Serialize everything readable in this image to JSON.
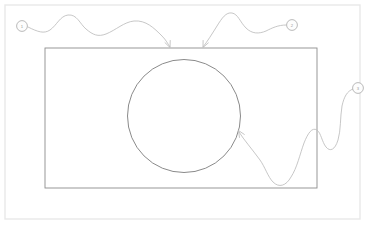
{
  "scene": {
    "type": "sketch-diagram",
    "background_color": "#ffffff",
    "width": 371,
    "height": 227
  },
  "frame": {
    "name": "outer-page-frame",
    "x": 5,
    "y": 5,
    "width": 355,
    "height": 214,
    "stroke": "#e8e8e8",
    "stroke_width": 1.4
  },
  "rectangle": {
    "name": "main-rectangle",
    "x": 45,
    "y": 48,
    "width": 272,
    "height": 140,
    "stroke": "#8d8d8d",
    "stroke_width": 0.9,
    "fill": "none"
  },
  "circle": {
    "name": "main-circle",
    "cx": 184,
    "cy": 116,
    "r": 56.5,
    "stroke": "#7d7d7d",
    "stroke_width": 0.9,
    "fill": "none"
  },
  "markers": [
    {
      "id": "marker-1",
      "label": "1",
      "cx": 22,
      "cy": 26,
      "r": 5.4,
      "stroke": "#a8a8a8",
      "fill": "#fdfdfd"
    },
    {
      "id": "marker-2",
      "label": "2",
      "cx": 292,
      "cy": 25,
      "r": 5.4,
      "stroke": "#a8a8a8",
      "fill": "#fdfdfd"
    },
    {
      "id": "marker-3",
      "label": "3",
      "cx": 358,
      "cy": 88,
      "r": 5.4,
      "stroke": "#a8a8a8",
      "fill": "#fdfdfd"
    }
  ],
  "connectors": [
    {
      "id": "connector-1",
      "from_marker": "marker-1",
      "to_target": "rectangle-top-edge",
      "path": "M 28 27 C 38 32, 44 34, 50 30 C 57 25, 60 16, 68 15 C 77 14, 80 24, 86 29 C 93 35, 98 37, 106 34 C 116 30, 124 22, 134 21 C 146 20, 154 28, 162 36 C 166 40, 168 44, 170 47",
      "stroke": "#bdbdbd",
      "stroke_width": 0.85,
      "arrow_at": {
        "x": 170,
        "y": 47.5,
        "angle": 68
      }
    },
    {
      "id": "connector-2",
      "from_marker": "marker-2",
      "to_target": "rectangle-top-edge",
      "path": "M 286 25 C 278 25, 272 28, 266 31 C 259 34, 252 34, 246 28 C 240 22, 238 14, 232 13 C 226 12, 222 18, 217 26 C 212 34, 207 42, 203 47",
      "stroke": "#bdbdbd",
      "stroke_width": 0.85,
      "arrow_at": {
        "x": 203,
        "y": 47.5,
        "angle": 115
      }
    },
    {
      "id": "connector-3",
      "from_marker": "marker-3",
      "to_target": "circle-right-edge",
      "path": "M 353 89 C 347 91, 344 97, 342 106 C 340 118, 341 130, 338 140 C 335 150, 330 152, 326 147 C 322 142, 321 133, 317 130 C 312 127, 308 133, 304 143 C 300 154, 297 168, 291 177 C 286 186, 279 188, 273 182 C 268 177, 265 167, 260 160 C 252 149, 244 140, 239 132",
      "stroke": "#bdbdbd",
      "stroke_width": 0.85,
      "arrow_at": {
        "x": 238.5,
        "y": 130.5,
        "angle": 238
      }
    }
  ]
}
